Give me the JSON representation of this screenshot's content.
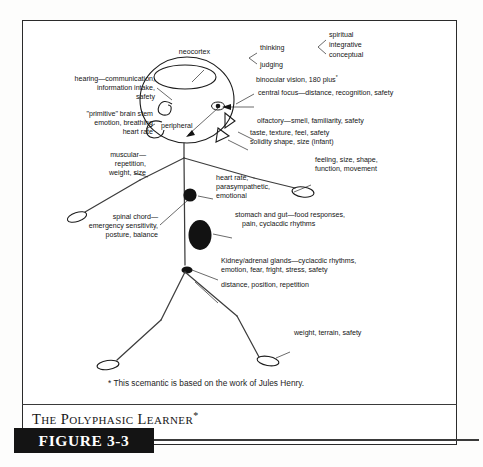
{
  "figure": {
    "running_title": "The Polyphasic Learner",
    "running_title_sup": "*",
    "figure_tab": "FIGURE 3-3",
    "footnote": "* This scemantic is based on the work of Jules Henry."
  },
  "diagram": {
    "type": "annotated-schematic",
    "head_labels": {
      "neocortex": "neocortex",
      "thinking": "thinking",
      "judging": "judging",
      "spiritual": "spiritual",
      "integrative": "integrative",
      "conceptual": "conceptual",
      "peripheral": "peripheral"
    },
    "left_labels": [
      {
        "id": "hearing",
        "lines": [
          "hearing—communication,",
          "information intake,",
          "safety"
        ]
      },
      {
        "id": "brain-stem",
        "lines": [
          "\"primitive\"  brain stem",
          "emotion, breathing",
          "heart rate"
        ]
      },
      {
        "id": "muscular",
        "lines": [
          "muscular—",
          "repetition,",
          "weight, size"
        ]
      },
      {
        "id": "spinal-chord",
        "lines": [
          "spinal chord—",
          "emergency sensitivity,",
          "posture, balance"
        ]
      }
    ],
    "right_labels": [
      {
        "id": "binocular-vision",
        "lines": [
          "binocular vision, 180 plus"
        ],
        "superscript": "*"
      },
      {
        "id": "central-focus",
        "lines": [
          "central focus—distance, recognition, safety"
        ]
      },
      {
        "id": "olfactory",
        "lines": [
          "olfactory—smell, familiarity, safety"
        ]
      },
      {
        "id": "taste",
        "lines": [
          "taste, texture, feel, safety",
          "solidity shape, size (infant)"
        ]
      },
      {
        "id": "feeling-hand",
        "lines": [
          "feeling, size, shape,",
          "function, movement"
        ]
      },
      {
        "id": "heart-rate",
        "lines": [
          "heart rate,",
          "parasympathetic,",
          "emotional"
        ]
      },
      {
        "id": "stomach-gut",
        "lines": [
          "stomach and gut—food responses,",
          "pain, cyclacdic rhythms"
        ]
      },
      {
        "id": "kidney-adrenal",
        "lines": [
          "Kidney/adrenal glands—cyclacdic rhythms,",
          "emotion, fear, fright, stress, safety"
        ]
      },
      {
        "id": "distance-position",
        "lines": [
          "distance, position, repetition"
        ]
      },
      {
        "id": "weight-terrain",
        "lines": [
          "weight, terrain, safety"
        ]
      }
    ],
    "colors": {
      "ink": "#1b1b1b",
      "organ_fill": "#121212",
      "page": "#ffffff",
      "tab_background": "#141414",
      "tab_text": "#ffffff"
    }
  }
}
